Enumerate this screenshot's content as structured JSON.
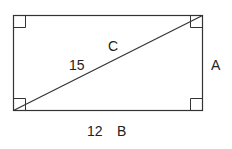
{
  "diagram": {
    "shape": "rectangle",
    "colors": {
      "stroke": "#333333",
      "text": "#222222",
      "background": "#ffffff"
    },
    "labels": {
      "diagonal_name": "C",
      "diagonal_length": "15",
      "side_right": "A",
      "side_bottom_length": "12",
      "side_bottom_name": "B"
    },
    "right_angle_markers": [
      "top-left",
      "top-right",
      "bottom-left",
      "bottom-right"
    ]
  }
}
